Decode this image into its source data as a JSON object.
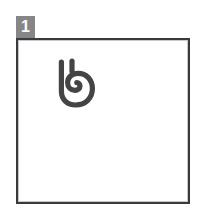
{
  "page": {
    "background_color": "#ffffff",
    "width": 206,
    "height": 215
  },
  "panel": {
    "name": "bordered-panel",
    "border_color": "#3a3a3c",
    "inner_rule_color": "#c9c9cb",
    "fill_color": "#ffffff",
    "border_width_px": 2
  },
  "badge": {
    "label": "1",
    "background_color": "#868688",
    "text_color": "#ffffff"
  },
  "glyph": {
    "name": "spiral-glyph",
    "description": "stylized hand-drawn spiral character",
    "stroke_color": "#444446",
    "stroke_width_px": 5,
    "fill": "none"
  }
}
